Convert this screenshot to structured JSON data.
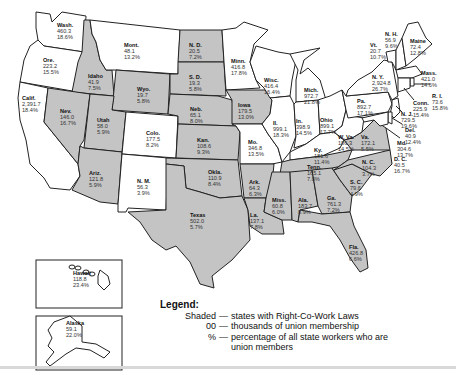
{
  "legend": {
    "title": "Legend:",
    "rows": [
      {
        "key": "Shaded",
        "dash": "—",
        "desc": "states with Right-Co-Work Laws"
      },
      {
        "key": "00",
        "dash": "—",
        "desc": "thousands of union membership"
      },
      {
        "key": "%",
        "dash": "—",
        "desc": "percentage of all state workers who are union members"
      }
    ]
  },
  "states": {
    "wa": {
      "name": "Wash.",
      "members": "460.3",
      "pct": "18.6%",
      "rtw": false
    },
    "or": {
      "name": "Ore.",
      "members": "223.2",
      "pct": "15.5%",
      "rtw": false
    },
    "ca": {
      "name": "Calif.",
      "members": "2,391.7",
      "pct": "18.4%",
      "rtw": false
    },
    "id": {
      "name": "Idaho",
      "members": "41.9",
      "pct": "7.5%",
      "rtw": true
    },
    "nv": {
      "name": "Nev.",
      "members": "146.0",
      "pct": "16.7%",
      "rtw": true
    },
    "mt": {
      "name": "Mont.",
      "members": "48.1",
      "pct": "13.2%",
      "rtw": false
    },
    "wy": {
      "name": "Wyo.",
      "members": "19.7",
      "pct": "5.8%",
      "rtw": true
    },
    "ut": {
      "name": "Utah",
      "members": "58.0",
      "pct": "5.9%",
      "rtw": true
    },
    "az": {
      "name": "Ariz.",
      "members": "121.8",
      "pct": "5.9%",
      "rtw": true
    },
    "co": {
      "name": "Colo.",
      "members": "177.5",
      "pct": "8.2%",
      "rtw": false
    },
    "nm": {
      "name": "N. M.",
      "members": "56.3",
      "pct": "3.9%",
      "rtw": false
    },
    "nd": {
      "name": "N. D.",
      "members": "20.5",
      "pct": "7.2%",
      "rtw": true
    },
    "sd": {
      "name": "S. D.",
      "members": "19.3",
      "pct": "5.8%",
      "rtw": true
    },
    "ne": {
      "name": "Neb.",
      "members": "65.1",
      "pct": "8.0%",
      "rtw": true
    },
    "ks": {
      "name": "Kan.",
      "members": "108.6",
      "pct": "9.3%",
      "rtw": true
    },
    "ok": {
      "name": "Okla.",
      "members": "110.9",
      "pct": "8.4%",
      "rtw": true
    },
    "tx": {
      "name": "Texas",
      "members": "502.0",
      "pct": "5.7%",
      "rtw": true
    },
    "mn": {
      "name": "Minn.",
      "members": "416.8",
      "pct": "17.8%",
      "rtw": false
    },
    "ia": {
      "name": "Iowa",
      "members": "179.5",
      "pct": "13.0%",
      "rtw": true
    },
    "mo": {
      "name": "Mo.",
      "members": "346.8",
      "pct": "13.5%",
      "rtw": false
    },
    "ar": {
      "name": "Ark.",
      "members": "64.3",
      "pct": "6.3%",
      "rtw": true
    },
    "la": {
      "name": "La.",
      "members": "137.1",
      "pct": "7.8%",
      "rtw": true
    },
    "wi": {
      "name": "Wisc.",
      "members": "416.4",
      "pct": "16.4%",
      "rtw": false
    },
    "il": {
      "name": "Il.",
      "members": "999.1",
      "pct": "18.3%",
      "rtw": false
    },
    "mi": {
      "name": "Mich.",
      "members": "972.7",
      "pct": "21.8%",
      "rtw": false
    },
    "in": {
      "name": "In.",
      "members": "398.9",
      "pct": "14.5%",
      "rtw": false
    },
    "oh": {
      "name": "Ohio",
      "members": "899.1",
      "pct": "17.7%",
      "rtw": false
    },
    "ky": {
      "name": "Ky.",
      "members": "181.6",
      "pct": "11.4%",
      "rtw": false
    },
    "tn": {
      "name": "Tenn.",
      "members": "165.1",
      "pct": "7.8%",
      "rtw": true
    },
    "ms": {
      "name": "Miss.",
      "members": "60.8",
      "pct": "6.0%",
      "rtw": true
    },
    "al": {
      "name": "Ala.",
      "members": "183.7",
      "pct": "8.9%",
      "rtw": true
    },
    "ga": {
      "name": "Ga.",
      "members": "761.3",
      "pct": "7.2%",
      "rtw": true
    },
    "fl": {
      "name": "Fla.",
      "members": "426.8",
      "pct": "6.6%",
      "rtw": true
    },
    "sc": {
      "name": "S. C.",
      "members": "79.6",
      "pct": "4.9%",
      "rtw": true
    },
    "nc": {
      "name": "N. C.",
      "members": "104.3",
      "pct": "3.7%",
      "rtw": true
    },
    "va": {
      "name": "Va.",
      "members": "172.1",
      "pct": "5.5%",
      "rtw": true
    },
    "wv": {
      "name": "W. Va.",
      "members": "186.3",
      "pct": "14.5%",
      "rtw": false
    },
    "pa": {
      "name": "Pa.",
      "members": "892.7",
      "pct": "17.1%",
      "rtw": false
    },
    "ny": {
      "name": "N. Y.",
      "members": "2,924.8",
      "pct": "26.7%",
      "rtw": false
    },
    "vt": {
      "name": "Vt.",
      "members": "20.7",
      "pct": "10.7%",
      "rtw": false
    },
    "nh": {
      "name": "N. H.",
      "members": "56.9",
      "pct": "9.6%",
      "rtw": false
    },
    "me": {
      "name": "Maine",
      "members": "72.4",
      "pct": "12.8%",
      "rtw": false
    },
    "ma": {
      "name": "Mass.",
      "members": "421.0",
      "pct": "14.6%",
      "rtw": false
    },
    "ri": {
      "name": "R. I.",
      "members": "73.6",
      "pct": "15.8%",
      "rtw": false
    },
    "ct": {
      "name": "Conn.",
      "members": "225.9",
      "pct": "15.4%",
      "rtw": false
    },
    "nj": {
      "name": "N. J.",
      "members": "729.5",
      "pct": "19.6%",
      "rtw": false
    },
    "de": {
      "name": "Del.",
      "members": "40.9",
      "pct": "12.4%",
      "rtw": false
    },
    "md": {
      "name": "Md.",
      "members": "304.6",
      "pct": "13.7%",
      "rtw": false
    },
    "dc": {
      "name": "D. C.",
      "members": "40.5",
      "pct": "16.7%",
      "rtw": false
    },
    "hi": {
      "name": "Hawaii",
      "members": "118.8",
      "pct": "23.4%",
      "rtw": false
    },
    "ak": {
      "name": "Alaska",
      "members": "59.1",
      "pct": "22.0%",
      "rtw": false
    }
  }
}
